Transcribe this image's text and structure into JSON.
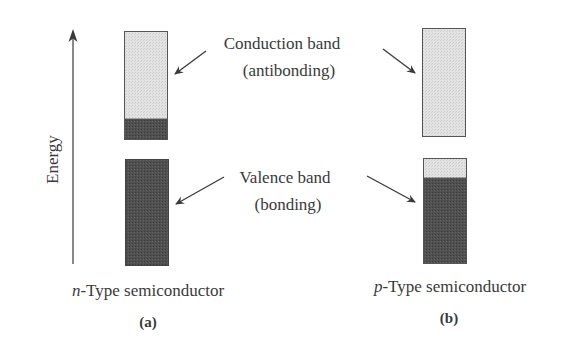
{
  "axis": {
    "label": "Energy"
  },
  "labels": {
    "conduction_line1": "Conduction band",
    "conduction_line2": "(antibonding)",
    "valence_line1": "Valence band",
    "valence_line2": "(bonding)"
  },
  "panels": [
    {
      "id": "a",
      "italic_prefix": "n",
      "title_rest": "-Type semiconductor",
      "caption": "(a)"
    },
    {
      "id": "b",
      "italic_prefix": "p",
      "title_rest": "-Type semiconductor",
      "caption": "(b)"
    }
  ],
  "colors": {
    "empty_band": "#dcdcdc",
    "filled_band": "#4a4a4a",
    "outline": "#555555",
    "arrow": "#3a3a3a"
  }
}
